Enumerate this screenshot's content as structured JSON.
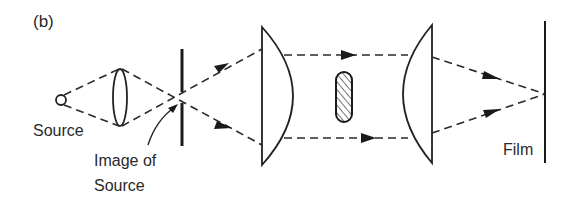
{
  "figure": {
    "panel_label": "(b)",
    "labels": {
      "source": "Source",
      "image_of_source_line1": "Image of",
      "image_of_source_line2": "Source",
      "film": "Film"
    },
    "components": [
      {
        "name": "point-source",
        "shape": "circle"
      },
      {
        "name": "condenser-lens",
        "shape": "biconvex"
      },
      {
        "name": "pinhole-aperture",
        "shape": "vertical-bar-with-gap"
      },
      {
        "name": "collimating-lens",
        "shape": "plano-convex"
      },
      {
        "name": "object",
        "shape": "hatched-rounded-rect"
      },
      {
        "name": "imaging-lens",
        "shape": "plano-convex"
      },
      {
        "name": "film-plane",
        "shape": "vertical-line"
      }
    ],
    "colors": {
      "ink": "#2a2a2a",
      "background": "#ffffff"
    }
  }
}
